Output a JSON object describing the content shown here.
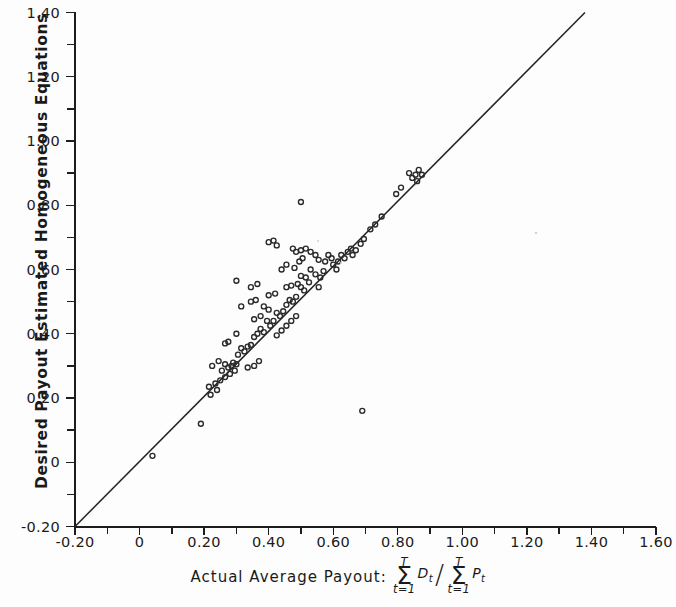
{
  "axes": {
    "ylabel": "Desired Payout Estimated Homogeneous Equations",
    "xlabel_prefix": "Actual Average Payout:",
    "formula": {
      "numerator_sigma_top": "T",
      "numerator_sigma_bottom": "t=1",
      "numerator_var": "D",
      "numerator_var_sub": "t",
      "divider": "/",
      "denominator_sigma_top": "T",
      "denominator_sigma_bottom": "t=1",
      "denominator_var": "P",
      "denominator_var_sub": "t"
    },
    "x_ticklabels": [
      "-0.20",
      "0",
      "0.20",
      "0.40",
      "0.60",
      "0.80",
      "1.00",
      "1.20",
      "1.40",
      "1.60"
    ],
    "x_tickvalues": [
      -0.2,
      0,
      0.2,
      0.4,
      0.6,
      0.8,
      1.0,
      1.2,
      1.4,
      1.6
    ],
    "y_ticklabels": [
      "-0.20",
      "0",
      "0.20",
      "0.40",
      "0.60",
      "0.80",
      "1.00",
      "1.20",
      "1.40"
    ],
    "y_tickvalues": [
      -0.2,
      0,
      0.2,
      0.4,
      0.6,
      0.8,
      1.0,
      1.2,
      1.4
    ]
  },
  "chart_data": {
    "type": "scatter",
    "title": "",
    "xlabel": "Actual Average Payout: sum(t=1..T) D_t / sum(t=1..T) P_t",
    "ylabel": "Desired Payout Estimated Homogeneous Equations",
    "xlim": [
      -0.2,
      1.6
    ],
    "ylim": [
      -0.2,
      1.4
    ],
    "xticks": [
      -0.2,
      0,
      0.2,
      0.4,
      0.6,
      0.8,
      1.0,
      1.2,
      1.4,
      1.6
    ],
    "yticks": [
      -0.2,
      0,
      0.2,
      0.4,
      0.6,
      0.8,
      1.0,
      1.2,
      1.4
    ],
    "xtick_minor_step": 0.1,
    "ytick_minor_step": 0.1,
    "grid": false,
    "legend": null,
    "marker": "open-circle",
    "marker_size_px": 5,
    "reference_line": {
      "label": "identity line (y = x)",
      "x": [
        -0.2,
        1.38
      ],
      "y": [
        -0.2,
        1.4
      ]
    },
    "points": [
      [
        0.04,
        0.02
      ],
      [
        0.19,
        0.12
      ],
      [
        0.22,
        0.21
      ],
      [
        0.24,
        0.225
      ],
      [
        0.235,
        0.245
      ],
      [
        0.255,
        0.285
      ],
      [
        0.225,
        0.3
      ],
      [
        0.245,
        0.315
      ],
      [
        0.265,
        0.305
      ],
      [
        0.275,
        0.295
      ],
      [
        0.285,
        0.3
      ],
      [
        0.29,
        0.31
      ],
      [
        0.3,
        0.305
      ],
      [
        0.295,
        0.285
      ],
      [
        0.305,
        0.335
      ],
      [
        0.265,
        0.37
      ],
      [
        0.275,
        0.375
      ],
      [
        0.315,
        0.355
      ],
      [
        0.325,
        0.345
      ],
      [
        0.335,
        0.36
      ],
      [
        0.345,
        0.365
      ],
      [
        0.3,
        0.4
      ],
      [
        0.355,
        0.39
      ],
      [
        0.365,
        0.4
      ],
      [
        0.375,
        0.415
      ],
      [
        0.385,
        0.405
      ],
      [
        0.355,
        0.445
      ],
      [
        0.375,
        0.455
      ],
      [
        0.395,
        0.44
      ],
      [
        0.405,
        0.425
      ],
      [
        0.415,
        0.44
      ],
      [
        0.345,
        0.5
      ],
      [
        0.36,
        0.505
      ],
      [
        0.385,
        0.485
      ],
      [
        0.4,
        0.475
      ],
      [
        0.425,
        0.465
      ],
      [
        0.435,
        0.455
      ],
      [
        0.445,
        0.47
      ],
      [
        0.4,
        0.52
      ],
      [
        0.42,
        0.525
      ],
      [
        0.345,
        0.545
      ],
      [
        0.365,
        0.555
      ],
      [
        0.3,
        0.565
      ],
      [
        0.315,
        0.485
      ],
      [
        0.455,
        0.49
      ],
      [
        0.465,
        0.505
      ],
      [
        0.475,
        0.5
      ],
      [
        0.485,
        0.515
      ],
      [
        0.455,
        0.545
      ],
      [
        0.47,
        0.55
      ],
      [
        0.49,
        0.555
      ],
      [
        0.5,
        0.545
      ],
      [
        0.51,
        0.535
      ],
      [
        0.5,
        0.58
      ],
      [
        0.515,
        0.575
      ],
      [
        0.525,
        0.56
      ],
      [
        0.44,
        0.6
      ],
      [
        0.455,
        0.615
      ],
      [
        0.48,
        0.605
      ],
      [
        0.495,
        0.625
      ],
      [
        0.505,
        0.635
      ],
      [
        0.485,
        0.655
      ],
      [
        0.5,
        0.66
      ],
      [
        0.515,
        0.665
      ],
      [
        0.53,
        0.655
      ],
      [
        0.545,
        0.645
      ],
      [
        0.555,
        0.63
      ],
      [
        0.53,
        0.6
      ],
      [
        0.545,
        0.585
      ],
      [
        0.56,
        0.575
      ],
      [
        0.57,
        0.595
      ],
      [
        0.575,
        0.625
      ],
      [
        0.585,
        0.645
      ],
      [
        0.595,
        0.635
      ],
      [
        0.6,
        0.615
      ],
      [
        0.61,
        0.6
      ],
      [
        0.615,
        0.625
      ],
      [
        0.625,
        0.645
      ],
      [
        0.635,
        0.635
      ],
      [
        0.645,
        0.655
      ],
      [
        0.655,
        0.665
      ],
      [
        0.66,
        0.645
      ],
      [
        0.67,
        0.66
      ],
      [
        0.685,
        0.68
      ],
      [
        0.695,
        0.695
      ],
      [
        0.4,
        0.685
      ],
      [
        0.415,
        0.69
      ],
      [
        0.425,
        0.675
      ],
      [
        0.475,
        0.665
      ],
      [
        0.5,
        0.81
      ],
      [
        0.69,
        0.16
      ],
      [
        0.555,
        0.545
      ],
      [
        0.335,
        0.295
      ],
      [
        0.355,
        0.3
      ],
      [
        0.37,
        0.315
      ],
      [
        0.425,
        0.395
      ],
      [
        0.44,
        0.41
      ],
      [
        0.455,
        0.425
      ],
      [
        0.47,
        0.44
      ],
      [
        0.485,
        0.455
      ],
      [
        0.25,
        0.255
      ],
      [
        0.265,
        0.265
      ],
      [
        0.28,
        0.275
      ],
      [
        0.215,
        0.235
      ],
      [
        0.795,
        0.835
      ],
      [
        0.81,
        0.855
      ],
      [
        0.835,
        0.9
      ],
      [
        0.845,
        0.885
      ],
      [
        0.855,
        0.895
      ],
      [
        0.86,
        0.875
      ],
      [
        0.865,
        0.91
      ],
      [
        0.875,
        0.895
      ],
      [
        0.75,
        0.765
      ],
      [
        0.715,
        0.725
      ],
      [
        0.73,
        0.74
      ]
    ]
  }
}
